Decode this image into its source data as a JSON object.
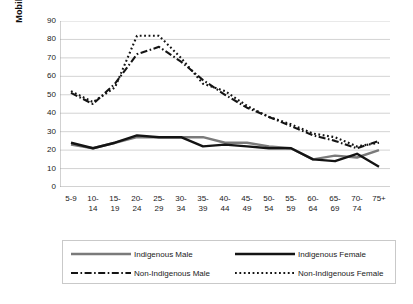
{
  "chart_data": {
    "type": "line",
    "title": "",
    "xlabel": "",
    "ylabel": "Mobility Rate (percent)",
    "ylim": [
      0,
      90
    ],
    "yticks": [
      90,
      80,
      70,
      60,
      50,
      40,
      30,
      20,
      10,
      0
    ],
    "grid": true,
    "legend_position": "bottom",
    "categories": [
      "5-9",
      "10-14",
      "15-19",
      "20-24",
      "25-29",
      "30-34",
      "35-39",
      "40-44",
      "45-49",
      "50-54",
      "55-59",
      "60-64",
      "65-69",
      "70-74",
      "75+"
    ],
    "series": [
      {
        "name": "Indigenous Male",
        "style": "solid",
        "color": "#7a7a7a",
        "values": [
          23,
          21,
          24,
          27,
          27,
          27,
          27,
          24,
          24,
          22,
          21,
          15,
          17,
          16,
          20
        ]
      },
      {
        "name": "Indigenous Female",
        "style": "solid",
        "color": "#141414",
        "values": [
          24,
          21,
          24,
          28,
          27,
          27,
          22,
          23,
          22,
          21,
          21,
          15,
          14,
          18,
          11
        ]
      },
      {
        "name": "Non-Indigenous Male",
        "style": "dash-dot",
        "color": "#141414",
        "values": [
          51,
          45,
          56,
          72,
          76,
          68,
          58,
          50,
          43,
          38,
          33,
          28,
          25,
          21,
          25
        ]
      },
      {
        "name": "Non-Indigenous Female",
        "style": "dotted",
        "color": "#141414",
        "values": [
          52,
          46,
          54,
          82,
          82,
          70,
          56,
          52,
          44,
          38,
          34,
          29,
          27,
          22,
          24
        ]
      }
    ]
  },
  "axis": {
    "y_label": "Mobility Rate (percent)",
    "y_tick_labels": [
      "90",
      "80",
      "70",
      "60",
      "50",
      "40",
      "30",
      "20",
      "10",
      "0"
    ],
    "x_tick_labels": [
      "5-9",
      "10-\n14",
      "15-\n19",
      "20-\n24",
      "25-\n29",
      "30-\n34",
      "35-\n39",
      "40-\n44",
      "45-\n49",
      "50-\n54",
      "55-\n59",
      "60-\n64",
      "65-\n69",
      "70-\n74",
      "75+"
    ]
  },
  "legend": {
    "items": [
      {
        "label": "Indigenous Male",
        "style": "solid",
        "color": "#7a7a7a"
      },
      {
        "label": "Indigenous Female",
        "style": "solid",
        "color": "#141414"
      },
      {
        "label": "Non-Indigenous Male",
        "style": "dash-dot",
        "color": "#141414"
      },
      {
        "label": "Non-Indigenous Female",
        "style": "dotted",
        "color": "#141414"
      }
    ]
  },
  "colors": {
    "indigenous_male": "#7a7a7a",
    "indigenous_female": "#141414",
    "non_indigenous": "#141414",
    "gridline": "#c0c0c0",
    "axis": "#9a9a9a",
    "background": "#ffffff"
  }
}
